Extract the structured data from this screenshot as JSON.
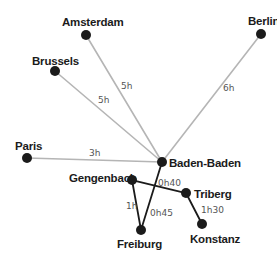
{
  "diagram": {
    "type": "travel-time-network",
    "colors": {
      "background": "#ffffff",
      "node": "#1b1b1b",
      "edge_long": "#b5b5b5",
      "edge_short": "#1b1b1b",
      "label": "#1b1b1b",
      "duration": "#555555"
    },
    "nodes": [
      {
        "id": "amsterdam",
        "label": "Amsterdam",
        "x": 86,
        "y": 35,
        "lx": 62,
        "ly": 26
      },
      {
        "id": "berlin",
        "label": "Berlin",
        "x": 261,
        "y": 34,
        "lx": 248,
        "ly": 25
      },
      {
        "id": "brussels",
        "label": "Brussels",
        "x": 55,
        "y": 71,
        "lx": 32,
        "ly": 65
      },
      {
        "id": "paris",
        "label": "Paris",
        "x": 27,
        "y": 158,
        "lx": 15,
        "ly": 150
      },
      {
        "id": "baden-baden",
        "label": "Baden-Baden",
        "x": 162,
        "y": 162,
        "lx": 169,
        "ly": 167
      },
      {
        "id": "gengenbach",
        "label": "Gengenbach",
        "x": 132,
        "y": 180,
        "lx": 69,
        "ly": 182
      },
      {
        "id": "triberg",
        "label": "Triberg",
        "x": 186,
        "y": 193,
        "lx": 194,
        "ly": 198
      },
      {
        "id": "konstanz",
        "label": "Konstanz",
        "x": 202,
        "y": 224,
        "lx": 190,
        "ly": 243
      },
      {
        "id": "freiburg",
        "label": "Freiburg",
        "x": 141,
        "y": 230,
        "lx": 117,
        "ly": 248
      }
    ],
    "edges": [
      {
        "from": "amsterdam",
        "to": "baden-baden",
        "label": "5h",
        "style": "long",
        "lx": 121,
        "ly": 89
      },
      {
        "from": "brussels",
        "to": "baden-baden",
        "label": "5h",
        "style": "long",
        "lx": 98,
        "ly": 103
      },
      {
        "from": "berlin",
        "to": "baden-baden",
        "label": "6h",
        "style": "long",
        "lx": 223,
        "ly": 91
      },
      {
        "from": "paris",
        "to": "baden-baden",
        "label": "3h",
        "style": "long",
        "lx": 89,
        "ly": 156
      },
      {
        "from": "gengenbach",
        "to": "triberg",
        "label": "0h40",
        "style": "short",
        "lx": 158,
        "ly": 186
      },
      {
        "from": "baden-baden",
        "to": "freiburg",
        "label": "0h45",
        "style": "short",
        "lx": 150,
        "ly": 216
      },
      {
        "from": "gengenbach",
        "to": "freiburg",
        "label": "1h",
        "style": "short",
        "lx": 126,
        "ly": 209
      },
      {
        "from": "triberg",
        "to": "konstanz",
        "label": "1h30",
        "style": "short",
        "lx": 201,
        "ly": 213
      }
    ]
  }
}
